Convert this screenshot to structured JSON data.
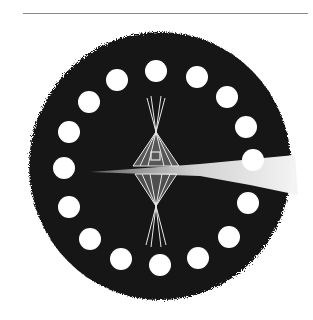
{
  "artwork": {
    "description": "Charcoal drawing of a dark circle ringed with sixteen white dots, a mirrored tipi in the center, and a pale light band streaming to the right",
    "colors": {
      "background": "#ffffff",
      "disk": "#161616",
      "dots": "#ffffff",
      "tipi": "#e8e8e8",
      "rule": "#8a8a8a"
    },
    "dots": [
      [
        156,
        71
      ],
      [
        197,
        77
      ],
      [
        227,
        97
      ],
      [
        246,
        127
      ],
      [
        253,
        160
      ],
      [
        248,
        203
      ],
      [
        229,
        237
      ],
      [
        198,
        258
      ],
      [
        160,
        265
      ],
      [
        121,
        259
      ],
      [
        90,
        239
      ],
      [
        69,
        207
      ],
      [
        64,
        168
      ],
      [
        69,
        132
      ],
      [
        89,
        102
      ],
      [
        117,
        80
      ]
    ],
    "dot_radius": 11
  }
}
